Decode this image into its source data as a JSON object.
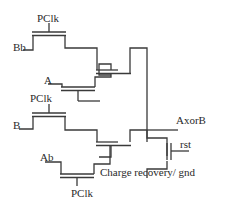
{
  "diagram": {
    "type": "transistor-level circuit schematic",
    "labels": {
      "pclk_top": "PClk",
      "bb": "Bb",
      "a": "A",
      "pclk_mid": "PClk",
      "b": "B",
      "ab": "Ab",
      "pclk_bottom": "PClk",
      "output": "AxorB",
      "reset": "rst",
      "charge_recovery": "Charge recovery/ gnd"
    },
    "colors": {
      "line": "#3a3a3a",
      "text": "#2a2a2a",
      "background": "#ffffff"
    }
  }
}
